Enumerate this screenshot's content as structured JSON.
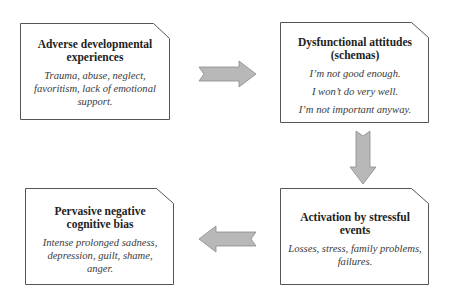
{
  "diagram": {
    "colors": {
      "box_border": "#555555",
      "box_fill": "#ffffff",
      "arrow_fill": "#b8b8b8",
      "arrow_stroke": "#8a8a8a"
    },
    "boxes": {
      "adverse": {
        "title": "Adverse developmental experiences",
        "desc": "Trauma, abuse, neglect, favoritism, lack of emotional support."
      },
      "dysfunctional": {
        "title": "Dysfunctional attitudes (schemas)",
        "lines": [
          "I’m not good enough.",
          "I won’t do very well.",
          "I’m not important anyway."
        ]
      },
      "activation": {
        "title": "Activation by stressful events",
        "desc": "Losses, stress, family problems, failures."
      },
      "pervasive": {
        "title": "Pervasive negative cognitive bias",
        "desc": "Intense prolonged sadness, depression, guilt, shame, anger."
      }
    },
    "arrows": [
      {
        "from": "adverse",
        "to": "dysfunctional",
        "direction": "right"
      },
      {
        "from": "dysfunctional",
        "to": "activation",
        "direction": "down"
      },
      {
        "from": "activation",
        "to": "pervasive",
        "direction": "left"
      }
    ]
  }
}
